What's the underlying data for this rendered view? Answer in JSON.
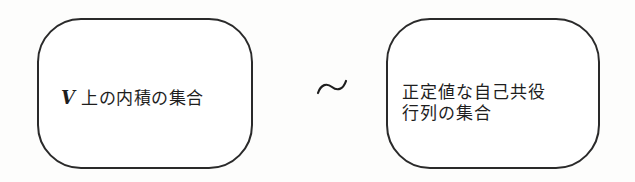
{
  "diagram": {
    "left_box": {
      "variable": "V",
      "text": "上の内積の集合"
    },
    "relation": {
      "symbol": "∼",
      "meaning": "one-to-one correspondence"
    },
    "right_box": {
      "lines": [
        "正定値な自己共役",
        "行列の集合"
      ]
    }
  }
}
